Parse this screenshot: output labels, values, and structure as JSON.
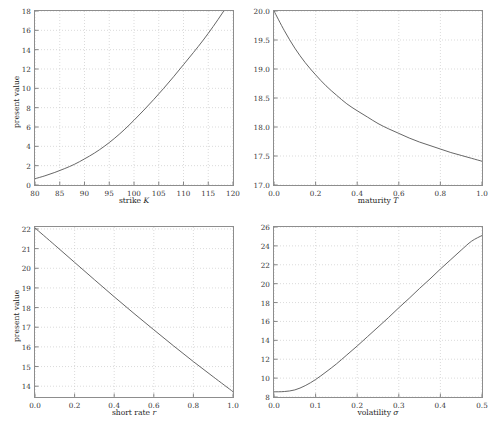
{
  "figure": {
    "background": "#ffffff",
    "axis_color": "#8d8d8d",
    "grid_color": "#cccccc",
    "curve_color": "#555555",
    "text_color": "#2b2b2b"
  },
  "chart_data": [
    {
      "type": "line",
      "panel": "top-left",
      "title": "",
      "xlabel": "strike K",
      "xlabel_plain": "strike",
      "xlabel_symbol": "K",
      "ylabel": "present value",
      "xlim": [
        80,
        120
      ],
      "ylim": [
        0,
        18
      ],
      "xticks": [
        80,
        85,
        90,
        95,
        100,
        105,
        110,
        115,
        120
      ],
      "xticklabels": [
        "80",
        "85",
        "90",
        "95",
        "100",
        "105",
        "110",
        "115",
        "120"
      ],
      "yticks": [
        0,
        2,
        4,
        6,
        8,
        10,
        12,
        14,
        16,
        18
      ],
      "yticklabels": [
        "0",
        "2",
        "4",
        "6",
        "8",
        "10",
        "12",
        "14",
        "16",
        "18"
      ],
      "grid": true,
      "legend": null,
      "series": [
        {
          "name": "present value vs strike",
          "x": [
            80,
            82,
            84,
            86,
            88,
            90,
            92,
            94,
            96,
            98,
            100,
            102,
            104,
            106,
            108,
            110,
            112,
            114,
            116,
            118,
            120
          ],
          "y": [
            0.65,
            0.95,
            1.3,
            1.7,
            2.15,
            2.7,
            3.3,
            4.0,
            4.8,
            5.7,
            6.7,
            7.75,
            8.85,
            10.0,
            11.2,
            12.45,
            13.7,
            15.0,
            16.4,
            17.9,
            19.5
          ]
        }
      ]
    },
    {
      "type": "line",
      "panel": "top-right",
      "title": "",
      "xlabel": "maturity T",
      "xlabel_plain": "maturity",
      "xlabel_symbol": "T",
      "ylabel": "",
      "xlim": [
        0.0,
        1.0
      ],
      "ylim": [
        17.0,
        20.0
      ],
      "xticks": [
        0.0,
        0.2,
        0.4,
        0.6,
        0.8,
        1.0
      ],
      "xticklabels": [
        "0.0",
        "0.2",
        "0.4",
        "0.6",
        "0.8",
        "1.0"
      ],
      "yticks": [
        17.0,
        17.5,
        18.0,
        18.5,
        19.0,
        19.5,
        20.0
      ],
      "yticklabels": [
        "17.0",
        "17.5",
        "18.0",
        "18.5",
        "19.0",
        "19.5",
        "20.0"
      ],
      "grid": true,
      "legend": null,
      "series": [
        {
          "name": "present value vs maturity",
          "x": [
            0.0,
            0.05,
            0.1,
            0.15,
            0.2,
            0.25,
            0.3,
            0.35,
            0.4,
            0.45,
            0.5,
            0.55,
            0.6,
            0.65,
            0.7,
            0.75,
            0.8,
            0.85,
            0.9,
            0.95,
            1.0
          ],
          "y": [
            20.0,
            19.66,
            19.36,
            19.11,
            18.9,
            18.71,
            18.55,
            18.4,
            18.28,
            18.17,
            18.06,
            17.97,
            17.89,
            17.81,
            17.74,
            17.68,
            17.62,
            17.56,
            17.51,
            17.46,
            17.41
          ]
        }
      ]
    },
    {
      "type": "line",
      "panel": "bottom-left",
      "title": "",
      "xlabel": "short rate r",
      "xlabel_plain": "short rate",
      "xlabel_symbol": "r",
      "ylabel": "present value",
      "xlim": [
        0.0,
        1.0
      ],
      "ylim": [
        13.45,
        22.1
      ],
      "xticks": [
        0.0,
        0.2,
        0.4,
        0.6,
        0.8,
        1.0
      ],
      "xticklabels": [
        "0.0",
        "0.2",
        "0.4",
        "0.6",
        "0.8",
        "1.0"
      ],
      "yticks": [
        14,
        15,
        16,
        17,
        18,
        19,
        20,
        21,
        22
      ],
      "yticklabels": [
        "14",
        "15",
        "16",
        "17",
        "18",
        "19",
        "20",
        "21",
        "22"
      ],
      "grid": true,
      "legend": null,
      "series": [
        {
          "name": "present value vs short rate",
          "x": [
            0.0,
            0.1,
            0.2,
            0.3,
            0.4,
            0.5,
            0.6,
            0.7,
            0.8,
            0.9,
            1.0
          ],
          "y": [
            22.05,
            21.18,
            20.3,
            19.42,
            18.55,
            17.7,
            16.87,
            16.05,
            15.25,
            14.48,
            13.72
          ]
        }
      ]
    },
    {
      "type": "line",
      "panel": "bottom-right",
      "title": "",
      "xlabel": "volatility σ",
      "xlabel_plain": "volatility",
      "xlabel_symbol": "σ",
      "ylabel": "",
      "xlim": [
        0.0,
        0.5
      ],
      "ylim": [
        8.0,
        26.0
      ],
      "xticks": [
        0.0,
        0.1,
        0.2,
        0.3,
        0.4,
        0.5
      ],
      "xticklabels": [
        "0.0",
        "0.1",
        "0.2",
        "0.3",
        "0.4",
        "0.5"
      ],
      "yticks": [
        8,
        10,
        12,
        14,
        16,
        18,
        20,
        22,
        24,
        26
      ],
      "yticklabels": [
        "8",
        "10",
        "12",
        "14",
        "16",
        "18",
        "20",
        "22",
        "24",
        "26"
      ],
      "grid": true,
      "legend": null,
      "series": [
        {
          "name": "present value vs volatility",
          "x": [
            0.0,
            0.025,
            0.05,
            0.075,
            0.1,
            0.125,
            0.15,
            0.175,
            0.2,
            0.225,
            0.25,
            0.275,
            0.3,
            0.325,
            0.35,
            0.375,
            0.4,
            0.425,
            0.45,
            0.475,
            0.5
          ],
          "y": [
            8.55,
            8.58,
            8.75,
            9.2,
            9.85,
            10.65,
            11.5,
            12.45,
            13.4,
            14.4,
            15.4,
            16.4,
            17.45,
            18.45,
            19.5,
            20.5,
            21.55,
            22.55,
            23.55,
            24.5,
            25.1
          ]
        }
      ]
    }
  ]
}
